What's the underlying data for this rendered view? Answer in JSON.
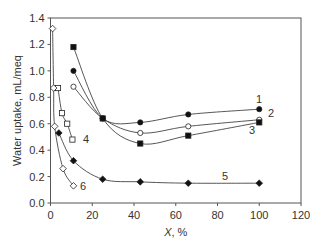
{
  "chart_data": {
    "type": "line",
    "title": "",
    "xlabel": "X, %",
    "ylabel": "Water uptake, mL/meq",
    "xlim": [
      0,
      120
    ],
    "ylim": [
      0,
      1.4
    ],
    "xticks": [
      0,
      20,
      40,
      60,
      80,
      100,
      120
    ],
    "yticks": [
      0.0,
      0.2,
      0.4,
      0.6,
      0.8,
      1.0,
      1.2,
      1.4
    ],
    "grid": false,
    "legend": "inline numeric labels",
    "series": [
      {
        "name": "1",
        "marker": "filled-circle",
        "x": [
          11,
          25,
          43,
          66,
          100
        ],
        "y": [
          1.0,
          0.64,
          0.61,
          0.67,
          0.71
        ]
      },
      {
        "name": "2",
        "marker": "open-circle",
        "x": [
          11,
          25,
          43,
          66,
          100
        ],
        "y": [
          0.88,
          0.64,
          0.53,
          0.58,
          0.63
        ]
      },
      {
        "name": "3",
        "marker": "filled-square",
        "x": [
          11,
          25,
          43,
          66,
          100
        ],
        "y": [
          1.18,
          0.64,
          0.45,
          0.51,
          0.61
        ]
      },
      {
        "name": "4",
        "marker": "open-square",
        "x": [
          3.6,
          5.5,
          8,
          10.5
        ],
        "y": [
          0.87,
          0.68,
          0.6,
          0.48
        ]
      },
      {
        "name": "5",
        "marker": "filled-diamond",
        "x": [
          4,
          11,
          25,
          43,
          66,
          100
        ],
        "y": [
          0.53,
          0.32,
          0.18,
          0.16,
          0.15,
          0.15
        ]
      },
      {
        "name": "6",
        "marker": "open-diamond",
        "x": [
          1,
          1.5,
          2,
          6,
          11
        ],
        "y": [
          1.32,
          0.87,
          0.58,
          0.26,
          0.13
        ]
      }
    ]
  }
}
